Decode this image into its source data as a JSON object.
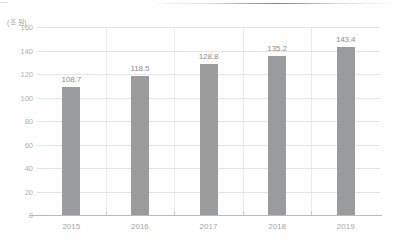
{
  "chart_data": {
    "type": "bar",
    "title": "",
    "subtitle": "",
    "unit_label": "(조 원)",
    "categories": [
      "2015",
      "2016",
      "2017",
      "2018",
      "2019"
    ],
    "values": [
      108.7,
      118.5,
      128.8,
      135.2,
      143.4
    ],
    "value_labels": [
      "108.7",
      "118.5",
      "128.8",
      "135.2",
      "143.4"
    ],
    "xlabel": "",
    "ylabel": "",
    "ylim": [
      0,
      160
    ],
    "yticks": [
      160,
      140,
      120,
      100,
      80,
      60,
      40,
      20,
      0
    ],
    "ytick_labels": [
      "160",
      "140",
      "120",
      "100",
      "80",
      "60",
      "40",
      "20",
      "0"
    ],
    "grid": true,
    "legend": "none",
    "series": [
      {
        "name": "",
        "values": [
          108.7,
          118.5,
          128.8,
          135.2,
          143.4
        ],
        "color": "#9a9b9c"
      }
    ],
    "colors": {
      "bar": "#9a9b9c",
      "gridline": "#cdcdcd",
      "axis": "#b9b9b9",
      "tick_text": "#aeaeae",
      "value_text": "#8e8e8e",
      "background": "#fefefe"
    }
  }
}
